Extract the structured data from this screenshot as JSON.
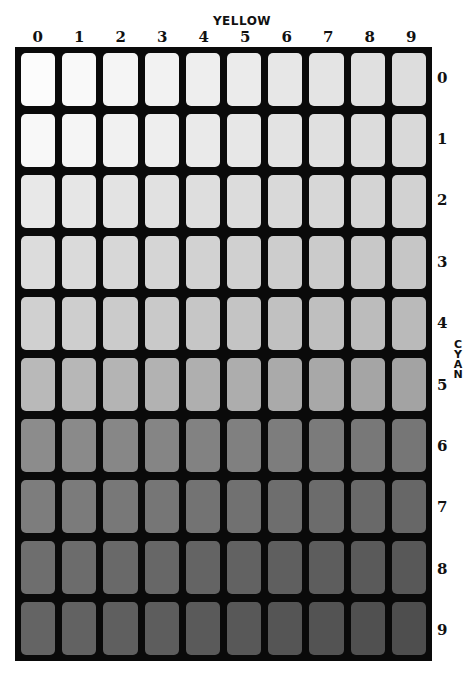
{
  "chart_data": {
    "type": "heatmap",
    "title": "",
    "xlabel": "YELLOW",
    "ylabel": "CYAN",
    "x_ticks": [
      "0",
      "1",
      "2",
      "3",
      "4",
      "5",
      "6",
      "7",
      "8",
      "9"
    ],
    "y_ticks": [
      "0",
      "1",
      "2",
      "3",
      "4",
      "5",
      "6",
      "7",
      "8",
      "9"
    ],
    "row_base_grey": [
      252,
      248,
      232,
      220,
      208,
      185,
      140,
      125,
      110,
      100
    ],
    "col_delta": 2.5
  },
  "labels": {
    "top_axis": "YELLOW",
    "right_axis": "CYAN",
    "columns": [
      "0",
      "1",
      "2",
      "3",
      "4",
      "5",
      "6",
      "7",
      "8",
      "9"
    ],
    "rows": [
      "0",
      "1",
      "2",
      "3",
      "4",
      "5",
      "6",
      "7",
      "8",
      "9"
    ]
  },
  "colors": {
    "frame": "#0a0a0a",
    "background": "#ffffff"
  }
}
